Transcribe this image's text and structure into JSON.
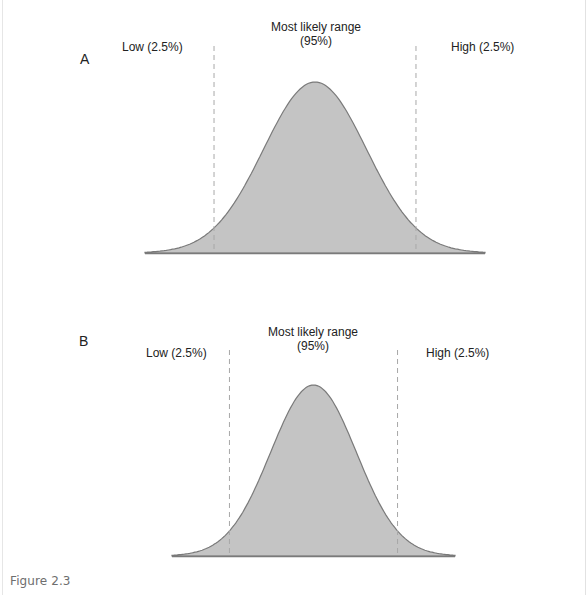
{
  "figure_caption": "Figure 2.3",
  "colors": {
    "fill": "#c4c4c4",
    "stroke": "#7a7a7a",
    "dashed": "#a8a8a8",
    "text": "#222222"
  },
  "chart_data": [
    {
      "type": "area",
      "panel_label": "A",
      "title": "Most likely range",
      "title_line2": "(95%)",
      "distribution": "normal",
      "mean": 0,
      "sd": 1,
      "x_range": [
        -3.3,
        3.3
      ],
      "low_cutoff": -1.96,
      "high_cutoff": 1.96,
      "low_label": "Low (2.5%)",
      "high_label": "High (2.5%)",
      "central_share_pct": 95,
      "tail_share_pct": 2.5,
      "grid": false,
      "axes_ticks": false
    },
    {
      "type": "area",
      "panel_label": "B",
      "title": "Most likely range",
      "title_line2": "(95%)",
      "distribution": "normal",
      "mean": 0,
      "sd": 1,
      "x_range": [
        -3.3,
        3.3
      ],
      "low_cutoff": -1.96,
      "high_cutoff": 1.96,
      "low_label": "Low (2.5%)",
      "high_label": "High (2.5%)",
      "central_share_pct": 95,
      "tail_share_pct": 2.5,
      "grid": false,
      "axes_ticks": false
    }
  ]
}
